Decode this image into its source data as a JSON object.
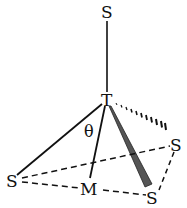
{
  "diagram": {
    "type": "molecular-geometry",
    "labels": {
      "top_s": "S",
      "center_t": "T",
      "theta": "θ",
      "right_s": "S",
      "left_s": "S",
      "midpoint_m": "M",
      "bottom_right_s": "S"
    },
    "bonds": [
      {
        "from": "S_top",
        "to": "T",
        "style": "solid"
      },
      {
        "from": "T",
        "to": "S_left",
        "style": "solid"
      },
      {
        "from": "T",
        "to": "M",
        "style": "solid"
      },
      {
        "from": "T",
        "to": "S_bottom_right",
        "style": "wedge"
      },
      {
        "from": "T",
        "to": "S_right",
        "style": "hashed"
      }
    ],
    "base_edges": [
      {
        "from": "S_left",
        "to": "S_right",
        "style": "dashed"
      },
      {
        "from": "S_left",
        "to": "M",
        "style": "dashed"
      },
      {
        "from": "M",
        "to": "S_bottom_right",
        "style": "dashed"
      },
      {
        "from": "S_right",
        "to": "S_bottom_right",
        "style": "dashed"
      }
    ],
    "colors": {
      "line": "#111111",
      "wedge": "#555555"
    }
  }
}
